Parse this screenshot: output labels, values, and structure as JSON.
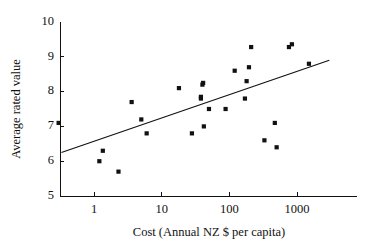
{
  "chart_data": {
    "type": "scatter",
    "title": "",
    "xlabel": "Cost (Annual NZ $ per capita)",
    "ylabel": "Average rated value",
    "xscale": "log",
    "yscale": "linear",
    "xlim": [
      0.25,
      4000
    ],
    "ylim": [
      5,
      10
    ],
    "xticks": [
      1,
      10,
      100,
      1000
    ],
    "xtick_labels": [
      "1",
      "10",
      "100",
      "1000"
    ],
    "yticks": [
      5,
      6,
      7,
      8,
      9,
      10
    ],
    "ytick_labels": [
      "5",
      "6",
      "7",
      "8",
      "9",
      "10"
    ],
    "grid": false,
    "legend": "none",
    "marker": "square",
    "marker_color": "#111111",
    "line_color": "#111111",
    "points": [
      {
        "x": 0.3,
        "y": 7.1
      },
      {
        "x": 1.2,
        "y": 6.0
      },
      {
        "x": 1.35,
        "y": 6.3
      },
      {
        "x": 2.3,
        "y": 5.7
      },
      {
        "x": 3.6,
        "y": 7.7
      },
      {
        "x": 5.0,
        "y": 7.2
      },
      {
        "x": 6.0,
        "y": 6.8
      },
      {
        "x": 18.0,
        "y": 8.1
      },
      {
        "x": 28.0,
        "y": 6.8
      },
      {
        "x": 38.0,
        "y": 7.8
      },
      {
        "x": 38.0,
        "y": 7.85
      },
      {
        "x": 40.0,
        "y": 8.2
      },
      {
        "x": 41.0,
        "y": 8.25
      },
      {
        "x": 42.0,
        "y": 7.0
      },
      {
        "x": 50.0,
        "y": 7.5
      },
      {
        "x": 88.0,
        "y": 7.5
      },
      {
        "x": 120.0,
        "y": 8.6
      },
      {
        "x": 170.0,
        "y": 7.8
      },
      {
        "x": 180.0,
        "y": 8.3
      },
      {
        "x": 195.0,
        "y": 8.7
      },
      {
        "x": 210.0,
        "y": 9.28
      },
      {
        "x": 330.0,
        "y": 6.6
      },
      {
        "x": 470.0,
        "y": 7.1
      },
      {
        "x": 500.0,
        "y": 6.4
      },
      {
        "x": 760.0,
        "y": 9.28
      },
      {
        "x": 840.0,
        "y": 9.36
      },
      {
        "x": 1500.0,
        "y": 8.8
      }
    ],
    "trend_line": {
      "description": "linear fit on log10(x)",
      "x_start": 0.33,
      "y_start": 6.25,
      "x_end": 3000,
      "y_end": 8.9
    }
  },
  "geometry": {
    "plot_left": 60,
    "plot_right": 357,
    "plot_top": 22,
    "plot_bottom": 196,
    "x_tick_px": {
      "1": 94,
      "10": 161.7,
      "100": 229.3,
      "1000": 297
    },
    "decade_px": 67.67
  }
}
